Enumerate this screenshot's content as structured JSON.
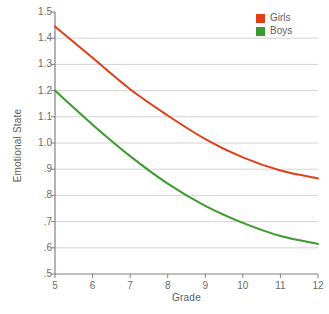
{
  "chart_data": {
    "type": "line",
    "title": "",
    "xlabel": "Grade",
    "ylabel": "Emotional State",
    "x": [
      5,
      6,
      7,
      8,
      9,
      10,
      11,
      12
    ],
    "xlim": [
      5,
      12
    ],
    "ylim": [
      0.5,
      1.5
    ],
    "xticks": [
      "5",
      "6",
      "7",
      "8",
      "9",
      "10",
      "11",
      "12"
    ],
    "yticks": [
      "1.5",
      "1.4",
      "1.3",
      "1.2",
      "1.1",
      "1.0",
      ".9",
      ".8",
      ".7",
      ".6",
      ".5"
    ],
    "grid": true,
    "legend_position": "top-right",
    "series": [
      {
        "name": "Girls",
        "color": "#E03E17",
        "values": [
          1.445,
          1.325,
          1.205,
          1.105,
          1.015,
          0.945,
          0.895,
          0.865
        ]
      },
      {
        "name": "Boys",
        "color": "#3C9A2E",
        "values": [
          1.2,
          1.07,
          0.95,
          0.845,
          0.76,
          0.695,
          0.645,
          0.615
        ]
      }
    ]
  },
  "legend": {
    "items": [
      {
        "label": "Girls",
        "color": "#E03E17"
      },
      {
        "label": "Boys",
        "color": "#3C9A2E"
      }
    ]
  },
  "colors": {
    "girls": "#E03E17",
    "boys": "#3C9A2E",
    "grid": "#d4d4d4",
    "axis": "#808080",
    "text": "#5d5d5d",
    "background": "#ffffff"
  }
}
